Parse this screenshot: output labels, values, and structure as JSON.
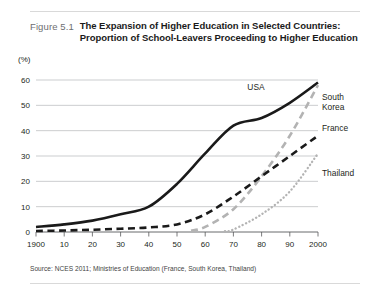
{
  "figure": {
    "number": "Figure 5.1",
    "title_line1": "The Expansion of Higher Education in Selected Countries:",
    "title_line2": "Proportion of School-Leavers Proceeding to Higher Education",
    "source": "Source: NCES 2011; Ministries of Education (France, South Korea, Thailand)"
  },
  "chart_data": {
    "type": "line",
    "title": "The Expansion of Higher Education in Selected Countries: Proportion of School-Leavers Proceeding to Higher Education",
    "xlabel": "",
    "ylabel": "(%)",
    "unit_label": "(%)",
    "xlim": [
      1900,
      2000
    ],
    "ylim": [
      0,
      60
    ],
    "yticks": [
      0,
      10,
      20,
      30,
      40,
      50,
      60
    ],
    "ytick_labels": [
      "0",
      "10",
      "20",
      "30",
      "40",
      "50",
      "60"
    ],
    "xticks": [
      1900,
      1910,
      1920,
      1930,
      1940,
      1950,
      1960,
      1970,
      1980,
      1990,
      2000
    ],
    "xtick_labels": [
      "1900",
      "10",
      "20",
      "30",
      "40",
      "50",
      "60",
      "70",
      "80",
      "90",
      "2000"
    ],
    "grid": "horizontal",
    "legend": "inline-right-labels",
    "series": [
      {
        "name": "USA",
        "color": "#1a1a1a",
        "style": "solid",
        "label_x": 1978,
        "label_y": 56,
        "x": [
          1900,
          1910,
          1920,
          1930,
          1940,
          1950,
          1960,
          1970,
          1980,
          1990,
          2000
        ],
        "values": [
          2,
          3,
          4.5,
          7,
          10,
          19,
          31,
          42,
          45,
          51,
          59
        ]
      },
      {
        "name": "South Korea",
        "color": "#b3b3b3",
        "style": "dashed",
        "label_x": 2002,
        "label_y": 52,
        "x": [
          1955,
          1960,
          1970,
          1980,
          1990,
          2000
        ],
        "values": [
          0.5,
          2,
          9,
          22,
          38,
          58
        ]
      },
      {
        "name": "France",
        "color": "#1a1a1a",
        "style": "dashed",
        "label_x": 2002,
        "label_y": 40,
        "x": [
          1900,
          1910,
          1920,
          1930,
          1940,
          1950,
          1960,
          1970,
          1980,
          1990,
          2000
        ],
        "values": [
          0.4,
          0.6,
          0.9,
          1.3,
          1.8,
          3,
          7,
          14,
          22,
          30,
          38
        ]
      },
      {
        "name": "Thailand",
        "color": "#b3b3b3",
        "style": "dotted",
        "label_x": 2002,
        "label_y": 22,
        "x": [
          1967,
          1970,
          1980,
          1990,
          2000
        ],
        "values": [
          0.3,
          1,
          7,
          16,
          31
        ]
      }
    ]
  }
}
